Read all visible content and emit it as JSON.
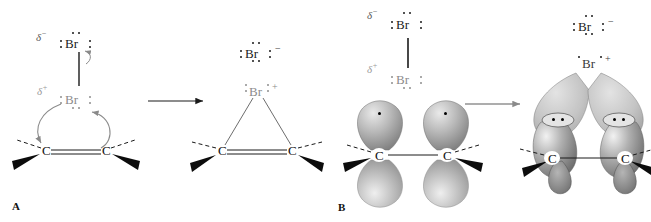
{
  "figure": {
    "panels": [
      {
        "id": "A",
        "letter": "A",
        "representation": "Lewis structure mechanism"
      },
      {
        "id": "B",
        "letter": "B",
        "representation": "Orbital overlap mechanism"
      }
    ]
  },
  "labels": {
    "bromine": "Br",
    "carbon": "C",
    "delta_negative": "δ",
    "delta_positive": "δ",
    "minus_sign": "−",
    "plus_sign": "+",
    "bromide_charge": "−",
    "bromonium_charge": "+"
  },
  "panelA": {
    "letter": "A",
    "reactants": {
      "br_top": {
        "symbol": "Br",
        "delta": "δ",
        "delta_sign": "−",
        "lone_pairs": 3
      },
      "br_bottom": {
        "symbol": "Br",
        "delta": "δ",
        "delta_sign": "+",
        "lone_pairs": 3
      },
      "alkene": {
        "left_atom": "C",
        "right_atom": "C",
        "bond": "double"
      },
      "curved_arrows": [
        {
          "name": "br-to-carbon",
          "from": "Br(delta+)",
          "to": "left carbon"
        },
        {
          "name": "pi-to-br",
          "from": "C=C pi bond",
          "to": "Br(delta+)"
        },
        {
          "name": "br-br-heterolysis",
          "from": "Br-Br bond",
          "to": "Br(delta-)"
        }
      ]
    },
    "products": {
      "bromide": {
        "symbol": "Br",
        "charge": "−",
        "lone_pairs": 4
      },
      "bromonium": {
        "symbol": "Br",
        "charge": "+",
        "ring": "three-membered"
      },
      "ring_carbons": [
        "C",
        "C"
      ]
    },
    "reaction_arrow": "→"
  },
  "panelB": {
    "letter": "B",
    "reactants": {
      "br_top": {
        "symbol": "Br",
        "delta": "δ",
        "delta_sign": "−",
        "lone_pairs": 3
      },
      "br_bottom": {
        "symbol": "Br",
        "delta": "δ",
        "delta_sign": "+",
        "lone_pairs": 3
      },
      "alkene_carbons": [
        "C",
        "C"
      ],
      "p_orbital_electrons": 2
    },
    "products": {
      "bromide": {
        "symbol": "Br",
        "charge": "−",
        "lone_pairs": 4
      },
      "bromonium": {
        "symbol": "Br",
        "charge": "+"
      },
      "ring_carbons": [
        "C",
        "C"
      ],
      "overlap_electron_pairs": 2
    },
    "reaction_arrow": "→"
  },
  "colors": {
    "ink": "#1a1a1a",
    "gray_atom": "#8c8c8c",
    "orbital_light": "#d8d8d8",
    "orbital_dark": "#6e6e6e",
    "background": "#ffffff"
  }
}
